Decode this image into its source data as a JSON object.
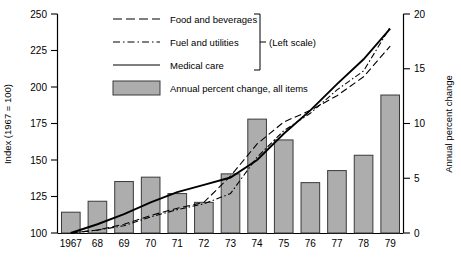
{
  "chart_data": {
    "type": "bar",
    "title": "",
    "xlabel": "",
    "ylabel": "Index (1967 = 100)",
    "y2label": "Annual percent change",
    "ylim": [
      100,
      250
    ],
    "y2lim": [
      0,
      20
    ],
    "yticks": [
      "100",
      "125",
      "150",
      "175",
      "200",
      "225",
      "250"
    ],
    "ytick_values": [
      100,
      125,
      150,
      175,
      200,
      225,
      250
    ],
    "y2ticks": [
      "0",
      "5",
      "10",
      "15",
      "20"
    ],
    "y2tick_values": [
      0,
      5,
      10,
      15,
      20
    ],
    "grid": false,
    "legend_position": "top-left",
    "categories": [
      "1967",
      "68",
      "69",
      "70",
      "71",
      "72",
      "73",
      "74",
      "75",
      "76",
      "77",
      "78",
      "79"
    ],
    "bars": {
      "name": "Annual percent change, all items",
      "axis": "right",
      "values": [
        1.9,
        2.9,
        4.7,
        5.1,
        3.6,
        2.8,
        5.4,
        10.4,
        8.5,
        4.6,
        5.7,
        7.1,
        12.6
      ]
    },
    "series": [
      {
        "name": "Food and beverages",
        "axis": "left",
        "style": "dashed",
        "values": [
          100,
          102,
          106,
          112,
          117,
          121,
          139,
          161,
          176,
          184,
          194,
          207,
          228
        ]
      },
      {
        "name": "Fuel and utilities",
        "axis": "left",
        "style": "dash-dot",
        "values": [
          100,
          102,
          105,
          111,
          116,
          120,
          127,
          152,
          170,
          182,
          198,
          211,
          241
        ]
      },
      {
        "name": "Medical care",
        "axis": "left",
        "style": "solid",
        "values": [
          100,
          106,
          113,
          121,
          128,
          133,
          138,
          150,
          168,
          184,
          202,
          219,
          240
        ]
      }
    ],
    "annotations": [
      {
        "text": "(Left scale)",
        "target": "first three series"
      }
    ]
  },
  "legend": {
    "items": [
      {
        "label": "Food and beverages",
        "style": "dashed"
      },
      {
        "label": "Fuel and utilities",
        "style": "dash-dot"
      },
      {
        "label": "Medical care",
        "style": "solid"
      },
      {
        "label": "Annual percent change, all items",
        "style": "swatch"
      }
    ],
    "bracket_note": "(Left scale)"
  },
  "colors": {
    "bar_fill": "#adadad",
    "bar_stroke": "#3a3a3a",
    "line": "#000000",
    "axis": "#000000",
    "background": "#ffffff"
  }
}
